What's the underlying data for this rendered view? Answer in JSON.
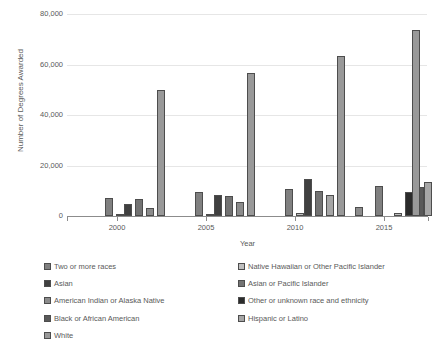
{
  "chart_data": {
    "type": "bar",
    "title": "",
    "subtitle": "",
    "xlabel": "Year",
    "ylabel": "Number of Degrees Awarded",
    "ylim": [
      0,
      80000
    ],
    "yticks": [
      0,
      20000,
      40000,
      60000,
      80000
    ],
    "ytick_labels": [
      "0",
      "20,000",
      "40,000",
      "60,000",
      "80,000"
    ],
    "xlim": [
      1999,
      2018
    ],
    "xticks": [
      2000,
      2005,
      2010,
      2015
    ],
    "xtick_labels": [
      "2000",
      "2005",
      "2010",
      "2015"
    ],
    "grid": true,
    "legend_position": "bottom",
    "series": [
      {
        "name": "Two or more races",
        "color": "#808080",
        "points": [
          {
            "x": 2000.0,
            "y": 7300
          },
          {
            "x": 2005.0,
            "y": 9400
          },
          {
            "x": 2010.0,
            "y": 10600
          },
          {
            "x": 2015.0,
            "y": 11700
          }
        ]
      },
      {
        "name": "Native Hawaiian or Other Pacific Islander",
        "color": "#bfbfbf",
        "points": [
          {
            "x": 2000.7,
            "y": 800
          },
          {
            "x": 2005.7,
            "y": 900
          },
          {
            "x": 2010.7,
            "y": 1100
          },
          {
            "x": 2015.7,
            "y": 1200
          }
        ]
      },
      {
        "name": "Asian",
        "color": "#404040",
        "points": [
          {
            "x": 2001.4,
            "y": 4800
          },
          {
            "x": 2006.4,
            "y": 8200
          },
          {
            "x": 2011.4,
            "y": 14800
          },
          {
            "x": 2016.4,
            "y": 8900
          }
        ]
      },
      {
        "name": "Asian or Pacific Islander",
        "color": "#737373",
        "points": [
          {
            "x": 2002.1,
            "y": 6900
          },
          {
            "x": 2007.1,
            "y": 7800
          },
          {
            "x": 2012.1,
            "y": 10000
          },
          {
            "x": 2017.1,
            "y": 1100
          }
        ]
      },
      {
        "name": "American Indian or Alaska Native",
        "color": "#8c8c8c",
        "points": [
          {
            "x": 2002.8,
            "y": 1000
          },
          {
            "x": 2007.8,
            "y": 1000
          },
          {
            "x": 2012.8,
            "y": 3500
          },
          {
            "x": 2017.8,
            "y": 1000
          }
        ]
      },
      {
        "name": "Other or unknown race and ethnicity",
        "color": "#2b2b2b",
        "points": [
          {
            "x": 2003.5,
            "y": 1100
          },
          {
            "x": 2008.5,
            "y": 1200
          },
          {
            "x": 2013.5,
            "y": 1200
          },
          {
            "x": 2018.5,
            "y": 9500
          }
        ]
      },
      {
        "name": "Black or African American",
        "color": "#595959",
        "points": [
          {
            "x": 2004.2,
            "y": 5200
          },
          {
            "x": 2009.2,
            "y": 5600
          },
          {
            "x": 2014.2,
            "y": 7700
          },
          {
            "x": 2019.2,
            "y": 11500
          }
        ]
      },
      {
        "name": "Hispanic or Latino",
        "color": "#a6a6a6",
        "points": [
          {
            "x": 2004.9,
            "y": 3100
          },
          {
            "x": 2009.9,
            "y": 4900
          },
          {
            "x": 2014.9,
            "y": 8200
          },
          {
            "x": 2019.9,
            "y": 13600
          }
        ]
      },
      {
        "name": "White",
        "color": "#999999",
        "points": [
          {
            "x": 2005.6,
            "y": 50000
          },
          {
            "x": 2010.6,
            "y": 56800
          },
          {
            "x": 2015.6,
            "y": 63200
          },
          {
            "x": 2020.6,
            "y": 73600
          }
        ]
      }
    ],
    "bars": [
      {
        "series": "Two or more races",
        "x_px": 38,
        "value": 7300,
        "color": "#808080"
      },
      {
        "series": "Native Hawaiian or Other Pacific Islander",
        "x_px": 49,
        "value": 800,
        "color": "#bfbfbf"
      },
      {
        "series": "Asian",
        "x_px": 57,
        "value": 4800,
        "color": "#404040"
      },
      {
        "series": "Asian or Pacific Islander",
        "x_px": 68,
        "value": 6900,
        "color": "#737373"
      },
      {
        "series": "American Indian or Alaska Native",
        "x_px": 79,
        "value": 3100,
        "color": "#8c8c8c"
      },
      {
        "series": "White",
        "x_px": 90,
        "value": 50000,
        "color": "#999999"
      },
      {
        "series": "Two or more races",
        "x_px": 128,
        "value": 9400,
        "color": "#808080"
      },
      {
        "series": "Native Hawaiian or Other Pacific Islander",
        "x_px": 139,
        "value": 800,
        "color": "#bfbfbf"
      },
      {
        "series": "Asian",
        "x_px": 147,
        "value": 8200,
        "color": "#404040"
      },
      {
        "series": "Asian or Pacific Islander",
        "x_px": 158,
        "value": 7800,
        "color": "#737373"
      },
      {
        "series": "American Indian or Alaska Native",
        "x_px": 169,
        "value": 5600,
        "color": "#8c8c8c"
      },
      {
        "series": "White",
        "x_px": 180,
        "value": 56800,
        "color": "#999999"
      },
      {
        "series": "Two or more races",
        "x_px": 218,
        "value": 10600,
        "color": "#808080"
      },
      {
        "series": "Native Hawaiian or Other Pacific Islander",
        "x_px": 229,
        "value": 1100,
        "color": "#bfbfbf"
      },
      {
        "series": "Asian",
        "x_px": 237,
        "value": 14800,
        "color": "#404040"
      },
      {
        "series": "Asian or Pacific Islander",
        "x_px": 248,
        "value": 10000,
        "color": "#737373"
      },
      {
        "series": "Hispanic or Latino",
        "x_px": 259,
        "value": 8200,
        "color": "#a6a6a6"
      },
      {
        "series": "White",
        "x_px": 270,
        "value": 63200,
        "color": "#999999"
      },
      {
        "series": "American Indian or Alaska Native",
        "x_px": 288,
        "value": 3500,
        "color": "#8c8c8c"
      },
      {
        "series": "Two or more races",
        "x_px": 308,
        "value": 11700,
        "color": "#808080"
      },
      {
        "series": "Native Hawaiian or Other Pacific Islander",
        "x_px": 327,
        "value": 1100,
        "color": "#bfbfbf"
      },
      {
        "series": "Other or unknown race and ethnicity",
        "x_px": 338,
        "value": 9500,
        "color": "#2b2b2b"
      },
      {
        "series": "Black or African American",
        "x_px": 349,
        "value": 11500,
        "color": "#595959"
      },
      {
        "series": "Hispanic or Latino",
        "x_px": 357,
        "value": 13600,
        "color": "#a6a6a6"
      },
      {
        "series": "White",
        "x_px": 345,
        "value": 73600,
        "color": "#999999"
      }
    ]
  },
  "axes": {
    "y_title": "Number of Degrees Awarded",
    "x_title": "Year",
    "y_ticks": [
      {
        "label": "80,000",
        "value": 80000
      },
      {
        "label": "60,000",
        "value": 60000
      },
      {
        "label": "40,000",
        "value": 40000
      },
      {
        "label": "20,000",
        "value": 20000
      },
      {
        "label": "0",
        "value": 0
      }
    ],
    "x_ticks": [
      {
        "label": "2000",
        "value": 2000
      },
      {
        "label": "2005",
        "value": 2005
      },
      {
        "label": "2010",
        "value": 2010
      },
      {
        "label": "2015",
        "value": 2015
      }
    ]
  },
  "legend": {
    "left_column": [
      {
        "label": "Two or more races",
        "color": "#808080"
      },
      {
        "label": "Asian",
        "color": "#404040"
      },
      {
        "label": "American Indian or Alaska Native",
        "color": "#8c8c8c"
      },
      {
        "label": "Black or African American",
        "color": "#595959"
      },
      {
        "label": "White",
        "color": "#999999"
      }
    ],
    "right_column": [
      {
        "label": "Native Hawaiian or Other Pacific Islander",
        "color": "#bfbfbf"
      },
      {
        "label": "Asian or Pacific Islander",
        "color": "#737373"
      },
      {
        "label": "Other or unknown race and ethnicity",
        "color": "#2b2b2b"
      },
      {
        "label": "Hispanic or Latino",
        "color": "#a6a6a6"
      }
    ]
  },
  "colors": {
    "background": "#ffffff",
    "gridline": "#e6e6e6",
    "axis": "#8c8c8c",
    "text": "#595959",
    "bar_outline": "#4d4d4d"
  }
}
